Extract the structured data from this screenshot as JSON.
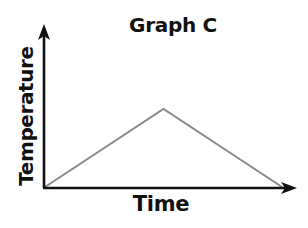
{
  "chart_data": {
    "type": "line",
    "title": "Graph C",
    "xlabel": "Time",
    "ylabel": "Temperature",
    "x": [
      0,
      0.5,
      1
    ],
    "series": [
      {
        "name": "Temperature",
        "values": [
          0,
          0.5,
          0
        ]
      }
    ],
    "xlim": [
      0,
      1
    ],
    "ylim": [
      0,
      1
    ],
    "grid": false,
    "legend": null,
    "ticks": false,
    "colors": {
      "line": "#8a8a8a",
      "axes": "#111111"
    },
    "annotations": []
  },
  "labels": {
    "title": "Graph C",
    "xlabel": "Time",
    "ylabel": "Temperature"
  }
}
